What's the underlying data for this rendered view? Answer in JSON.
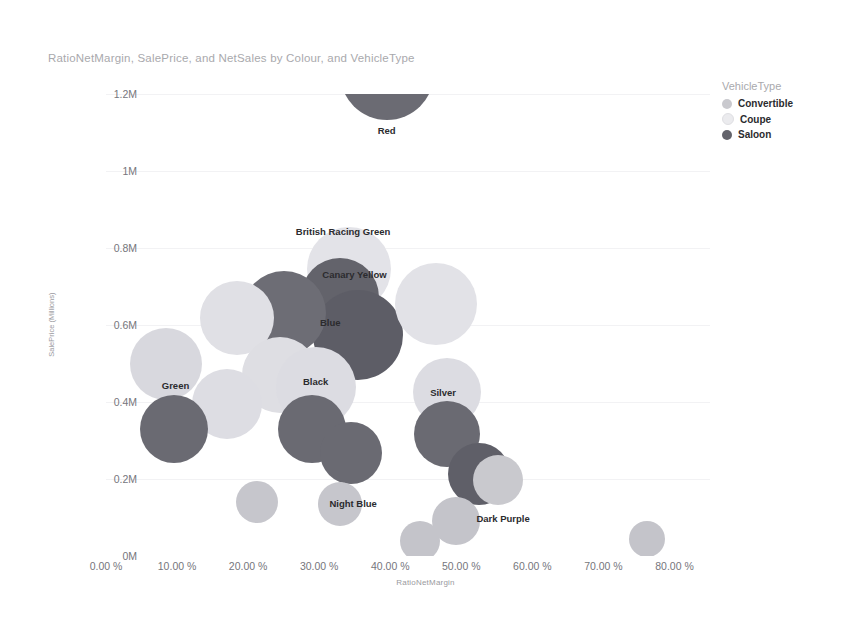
{
  "chart_data": {
    "type": "scatter",
    "title": "RatioNetMargin, SalePrice, and NetSales by Colour, and VehicleType",
    "xlabel": "RatioNetMargin",
    "ylabel": "SalePrice (Millions)",
    "xlim": [
      0,
      0.85
    ],
    "ylim": [
      0,
      1.2
    ],
    "grid": true,
    "x_ticks": [
      "0.00 %",
      "10.00 %",
      "20.00 %",
      "30.00 %",
      "40.00 %",
      "50.00 %",
      "60.00 %",
      "70.00 %",
      "80.00 %"
    ],
    "x_tick_values": [
      0,
      0.1,
      0.2,
      0.3,
      0.4,
      0.5,
      0.6,
      0.7,
      0.8
    ],
    "y_ticks": [
      "0M",
      "0.2M",
      "0.4M",
      "0.6M",
      "0.8M",
      "1M",
      "1.2M"
    ],
    "y_tick_values": [
      0,
      0.2,
      0.4,
      0.6,
      0.8,
      1.0,
      1.2
    ],
    "legend": {
      "title": "VehicleType",
      "position": "right",
      "entries": [
        {
          "name": "Convertible",
          "color": "#c9c9ce"
        },
        {
          "name": "Coupe",
          "color": "#ebebee"
        },
        {
          "name": "Saloon",
          "color": "#63636b"
        }
      ]
    },
    "size_encodes": "NetSales",
    "points": [
      {
        "label": "Red",
        "series": "Saloon",
        "x": 0.395,
        "y": 1.255,
        "r": 47,
        "color": "#6b6b73",
        "label_dx": 0,
        "label_dy": 57,
        "show_label": true
      },
      {
        "label": "British Racing Green",
        "series": "Coupe",
        "x": 0.342,
        "y": 0.745,
        "r": 42,
        "color": "#e3e3e8",
        "label_dx": -6,
        "label_dy": -38,
        "show_label": true
      },
      {
        "label": "Canary Yellow",
        "series": "Saloon",
        "x": 0.33,
        "y": 0.672,
        "r": 39,
        "color": "#63636b",
        "label_dx": 14,
        "label_dy": -23,
        "show_label": true
      },
      {
        "label": "Blue",
        "series": "Saloon",
        "x": 0.355,
        "y": 0.575,
        "r": 45,
        "color": "#5d5d66",
        "label_dx": -28,
        "label_dy": -13,
        "show_label": true
      },
      {
        "label": "Black",
        "series": "Saloon",
        "x": 0.25,
        "y": 0.63,
        "r": 42,
        "color": "#6d6d75",
        "label_dx": 0,
        "label_dy": 0,
        "show_label": false
      },
      {
        "label": "Coupe-A",
        "series": "Coupe",
        "x": 0.185,
        "y": 0.618,
        "r": 37,
        "color": "#e0e0e5",
        "label_dx": 0,
        "label_dy": 0,
        "show_label": false
      },
      {
        "label": "Coupe-B",
        "series": "Coupe",
        "x": 0.465,
        "y": 0.655,
        "r": 41,
        "color": "#e2e2e7",
        "label_dx": 0,
        "label_dy": 0,
        "show_label": false
      },
      {
        "label": "Convertible-A",
        "series": "Convertible",
        "x": 0.085,
        "y": 0.5,
        "r": 36,
        "color": "#d8d8de",
        "label_dx": 0,
        "label_dy": 0,
        "show_label": false
      },
      {
        "label": "Coupe-C",
        "series": "Coupe",
        "x": 0.245,
        "y": 0.47,
        "r": 38,
        "color": "#dedee3",
        "label_dx": 0,
        "label_dy": 0,
        "show_label": false
      },
      {
        "label": "Black",
        "series": "Coupe",
        "x": 0.295,
        "y": 0.44,
        "r": 40,
        "color": "#dcdce2",
        "label_dx": 0,
        "label_dy": -6,
        "show_label": true
      },
      {
        "label": "Convertible-B",
        "series": "Convertible",
        "x": 0.17,
        "y": 0.395,
        "r": 35,
        "color": "#dddde3",
        "label_dx": 0,
        "label_dy": 0,
        "show_label": false
      },
      {
        "label": "Silver",
        "series": "Convertible",
        "x": 0.48,
        "y": 0.425,
        "r": 34,
        "color": "#dcdce2",
        "label_dx": -4,
        "label_dy": 0,
        "show_label": true
      },
      {
        "label": "Green",
        "series": "Saloon",
        "x": 0.095,
        "y": 0.33,
        "r": 34,
        "color": "#6a6a72",
        "label_dx": 2,
        "label_dy": -44,
        "show_label": true
      },
      {
        "label": "Saloon-A",
        "series": "Saloon",
        "x": 0.29,
        "y": 0.33,
        "r": 34,
        "color": "#6a6a72",
        "label_dx": 0,
        "label_dy": 0,
        "show_label": false
      },
      {
        "label": "Night Blue",
        "series": "Saloon",
        "x": 0.345,
        "y": 0.268,
        "r": 31,
        "color": "#6a6a72",
        "label_dx": 2,
        "label_dy": 50,
        "show_label": true
      },
      {
        "label": "Saloon-B",
        "series": "Saloon",
        "x": 0.48,
        "y": 0.318,
        "r": 33,
        "color": "#6a6a72",
        "label_dx": 0,
        "label_dy": 0,
        "show_label": false
      },
      {
        "label": "Dark Purple",
        "series": "Saloon",
        "x": 0.525,
        "y": 0.212,
        "r": 31,
        "color": "#5f5f68",
        "label_dx": 24,
        "label_dy": 44,
        "show_label": true
      },
      {
        "label": "Convertible-C",
        "series": "Convertible",
        "x": 0.552,
        "y": 0.198,
        "r": 25,
        "color": "#c9c9ce",
        "label_dx": 0,
        "label_dy": 0,
        "show_label": false
      },
      {
        "label": "Convertible-D",
        "series": "Convertible",
        "x": 0.212,
        "y": 0.14,
        "r": 21,
        "color": "#c6c6cc",
        "label_dx": 0,
        "label_dy": 0,
        "show_label": false
      },
      {
        "label": "Convertible-E",
        "series": "Convertible",
        "x": 0.33,
        "y": 0.135,
        "r": 22,
        "color": "#c6c6cc",
        "label_dx": 0,
        "label_dy": 0,
        "show_label": false
      },
      {
        "label": "Convertible-F",
        "series": "Convertible",
        "x": 0.493,
        "y": 0.09,
        "r": 24,
        "color": "#c4c4ca",
        "label_dx": 0,
        "label_dy": 0,
        "show_label": false
      },
      {
        "label": "Convertible-G",
        "series": "Convertible",
        "x": 0.442,
        "y": 0.04,
        "r": 20,
        "color": "#c4c4ca",
        "label_dx": 0,
        "label_dy": 0,
        "show_label": false
      },
      {
        "label": "Convertible-H",
        "series": "Convertible",
        "x": 0.762,
        "y": 0.045,
        "r": 18,
        "color": "#c4c4ca",
        "label_dx": 0,
        "label_dy": 0,
        "show_label": false
      }
    ]
  }
}
